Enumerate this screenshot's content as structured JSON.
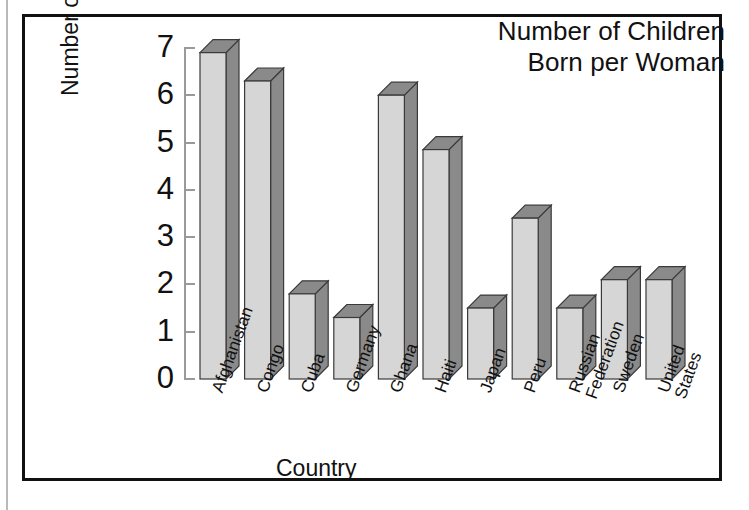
{
  "figure": {
    "title_line1": "Number of Children",
    "title_line2": "Born per Woman"
  },
  "axes": {
    "y_title": "Number of Children",
    "x_title": "Country",
    "y_ticks": [
      "0",
      "1",
      "2",
      "3",
      "4",
      "5",
      "6",
      "7"
    ]
  },
  "colors": {
    "bar_front": "#d6d6d6",
    "bar_side": "#8a8a8a",
    "bar_outline": "#3a3a3a",
    "axis": "#9a9a9a",
    "frame": "#111111",
    "text": "#111111",
    "background": "#ffffff"
  },
  "chart_data": {
    "type": "bar",
    "title": "Number of Children Born per Woman",
    "xlabel": "Country",
    "ylabel": "Number of Children",
    "ylim": [
      0,
      7
    ],
    "ytick_step": 1,
    "grid": false,
    "legend": false,
    "style": "3d-shaded-bars",
    "categories": [
      "Afghanistan",
      "Congo",
      "Cuba",
      "Germany",
      "Ghana",
      "Haiti",
      "Japan",
      "Peru",
      "Russian Federation",
      "Sweden",
      "United States"
    ],
    "category_label_lines": [
      [
        "Afghanistan"
      ],
      [
        "Congo"
      ],
      [
        "Cuba"
      ],
      [
        "Germany"
      ],
      [
        "Ghana"
      ],
      [
        "Haiti"
      ],
      [
        "Japan"
      ],
      [
        "Peru"
      ],
      [
        "Russian",
        "Federation"
      ],
      [
        "Sweden"
      ],
      [
        "United",
        "States"
      ]
    ],
    "values": [
      6.9,
      6.3,
      1.8,
      1.3,
      6.0,
      4.85,
      1.5,
      3.4,
      1.5,
      2.1,
      2.1
    ]
  }
}
